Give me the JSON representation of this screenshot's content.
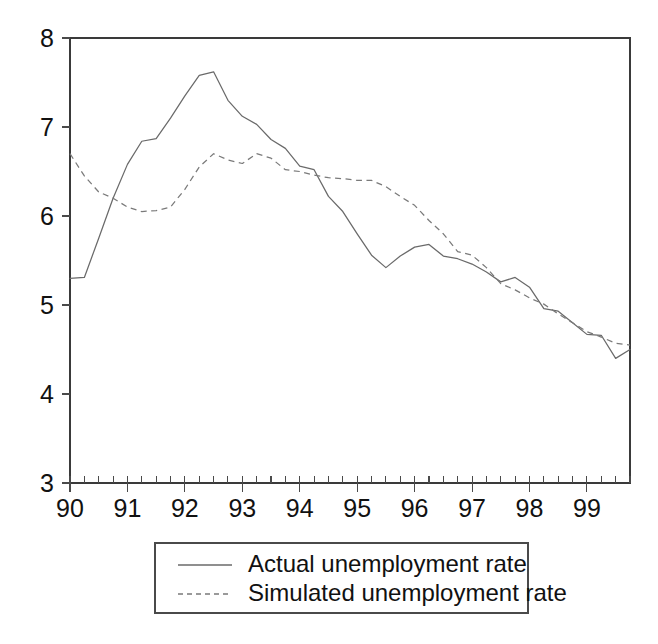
{
  "chart_data": {
    "type": "line",
    "title": "",
    "subtitle": "",
    "xlabel": "",
    "ylabel": "",
    "xlim": [
      1990.0,
      1999.75
    ],
    "ylim": [
      3,
      8
    ],
    "yticks": [
      3,
      4,
      5,
      6,
      7,
      8
    ],
    "ytick_labels": [
      "3",
      "4",
      "5",
      "6",
      "7",
      "8"
    ],
    "xticks": [
      1990,
      1991,
      1992,
      1993,
      1994,
      1995,
      1996,
      1997,
      1998,
      1999
    ],
    "xtick_labels": [
      "90",
      "91",
      "92",
      "93",
      "94",
      "95",
      "96",
      "97",
      "98",
      "99"
    ],
    "minor_xtick_interval": 0.25,
    "grid": false,
    "legend_position": "below-center",
    "x": [
      1990.0,
      1990.25,
      1990.5,
      1990.75,
      1991.0,
      1991.25,
      1991.5,
      1991.75,
      1992.0,
      1992.25,
      1992.5,
      1992.75,
      1993.0,
      1993.25,
      1993.5,
      1993.75,
      1994.0,
      1994.25,
      1994.5,
      1994.75,
      1995.0,
      1995.25,
      1995.5,
      1995.75,
      1996.0,
      1996.25,
      1996.5,
      1996.75,
      1997.0,
      1997.25,
      1997.5,
      1997.75,
      1998.0,
      1998.25,
      1998.5,
      1998.75,
      1999.0,
      1999.25,
      1999.5,
      1999.75
    ],
    "series": [
      {
        "name": "Actual unemployment rate",
        "style": "solid",
        "color": "#6a6a6a",
        "values": [
          5.3,
          5.31,
          5.75,
          6.2,
          6.58,
          6.84,
          6.87,
          7.1,
          7.35,
          7.58,
          7.62,
          7.3,
          7.12,
          7.03,
          6.86,
          6.76,
          6.56,
          6.52,
          6.22,
          6.05,
          5.8,
          5.56,
          5.42,
          5.55,
          5.65,
          5.68,
          5.55,
          5.52,
          5.46,
          5.37,
          5.26,
          5.31,
          5.2,
          4.96,
          4.93,
          4.8,
          4.67,
          4.66,
          4.4,
          4.5
        ]
      },
      {
        "name": "Simulated unemployment rate",
        "style": "dashed",
        "color": "#7a7a7a",
        "values": [
          6.7,
          6.45,
          6.27,
          6.2,
          6.1,
          6.05,
          6.06,
          6.1,
          6.3,
          6.55,
          6.7,
          6.63,
          6.59,
          6.7,
          6.65,
          6.52,
          6.5,
          6.46,
          6.43,
          6.42,
          6.4,
          6.4,
          6.33,
          6.22,
          6.12,
          5.95,
          5.8,
          5.6,
          5.56,
          5.42,
          5.24,
          5.17,
          5.08,
          5.01,
          4.9,
          4.8,
          4.7,
          4.64,
          4.57,
          4.55
        ]
      }
    ],
    "series_tail": {
      "note_actual_end": 4.1,
      "note_simulated_end": 3.25
    },
    "legend": [
      {
        "label": "Actual unemployment rate",
        "style": "solid",
        "marker": "line-solid"
      },
      {
        "label": "Simulated unemployment rate",
        "style": "dashed",
        "marker": "line-dashed"
      }
    ]
  },
  "figure": {
    "background_color": "#ffffff",
    "axis_color": "#3a3a3a",
    "text_color": "#111111"
  }
}
